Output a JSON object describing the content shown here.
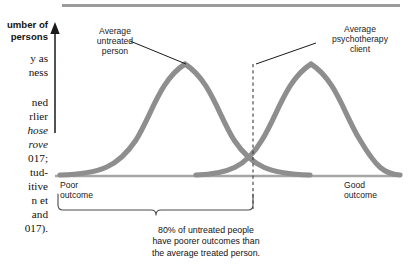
{
  "page": {
    "body_column_lines": [
      {
        "text": "umber of",
        "variant": "sans",
        "top": 19
      },
      {
        "text": "persons",
        "variant": "sans",
        "top": 31
      },
      {
        "text": "y as",
        "variant": "roman",
        "top": 53
      },
      {
        "text": "ness",
        "variant": "roman",
        "top": 67
      },
      {
        "text": "ned",
        "variant": "roman",
        "top": 97
      },
      {
        "text": "rlier",
        "variant": "roman",
        "top": 111
      },
      {
        "text": "hose",
        "variant": "italic",
        "top": 125
      },
      {
        "text": "rove",
        "variant": "italic",
        "top": 139
      },
      {
        "text": "017;",
        "variant": "roman",
        "top": 153
      },
      {
        "text": "tud-",
        "variant": "roman",
        "top": 167
      },
      {
        "text": "itive",
        "variant": "roman",
        "top": 181
      },
      {
        "text": "n et",
        "variant": "roman",
        "top": 195
      },
      {
        "text": "and",
        "variant": "roman",
        "top": 209
      },
      {
        "text": "017).",
        "variant": "roman",
        "top": 223
      }
    ]
  },
  "figure": {
    "y_axis_label": "Number of\npersons",
    "labels": {
      "untreated": "Average\nuntreated\nperson",
      "client": "Average\npsychotherapy\nclient",
      "poor_outcome": "Poor\noutcome",
      "good_outcome": "Good\noutcome"
    },
    "caption": "80% of untreated people\nhave poorer outcomes than\nthe average treated person.",
    "colors": {
      "curve": "#8e8e8e",
      "axis": "#a6a6a6",
      "rule": "#9b9b9b",
      "leader": "#1a1a1a",
      "dashed": "#3c3c3c",
      "brace": "#4a4a4a",
      "text": "#15120f"
    }
  },
  "chart_data": {
    "type": "line",
    "title": "",
    "xlabel": "Outcome",
    "ylabel": "Number of persons",
    "annotations": [
      "Average untreated person",
      "Average psychotherapy client",
      "80% of untreated people have poorer outcomes than the average treated person."
    ],
    "x_tick_labels": [
      "Poor outcome",
      "Good outcome"
    ],
    "grid": false,
    "legend": "none",
    "series": [
      {
        "name": "Average untreated person",
        "kind": "normal-distribution",
        "mean_x_px": 185,
        "peak_y_px": 63,
        "baseline_y_px": 176,
        "sigma_px": 46,
        "percentile_marked": 80
      },
      {
        "name": "Average psychotherapy client",
        "kind": "normal-distribution",
        "mean_x_px": 253,
        "peak_y_px": 63,
        "baseline_y_px": 176,
        "sigma_px": 46,
        "percentile_marked": 50
      }
    ],
    "marker_line": {
      "label": "average treated person",
      "x_px": 253,
      "from_y_px": 63,
      "to_y_px": 210,
      "style": "dashed"
    },
    "brace": {
      "label": "80% of untreated people have poorer outcomes than the average treated person.",
      "x_start_px": 58,
      "x_end_px": 253,
      "value": "80%"
    }
  }
}
